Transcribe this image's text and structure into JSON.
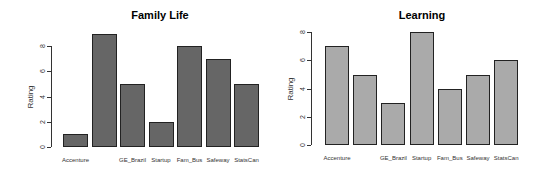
{
  "chart_data": [
    {
      "type": "bar",
      "title": "Family Life",
      "xlabel": "",
      "ylabel": "Rating",
      "categories": [
        "Accenture",
        "",
        "GE_Brazil",
        "Startup",
        "Fam_Bus",
        "Safeway",
        "StatsCan"
      ],
      "values": [
        1,
        9,
        5,
        2,
        8,
        7,
        5
      ],
      "yticks": [
        "0",
        "2",
        "4",
        "6",
        "8"
      ],
      "ylim": [
        0,
        9
      ],
      "grid": false,
      "bar_color": "#666666",
      "layout": {
        "left": 0,
        "axis_x": 55,
        "y0": 147,
        "px_per_unit": 12.6,
        "bar_start": 63,
        "bar_width": 25,
        "bar_step": 28.5,
        "title_x": 160,
        "ylabel_x": 30
      }
    },
    {
      "type": "bar",
      "title": "Learning",
      "xlabel": "",
      "ylabel": "Rating",
      "categories": [
        "Accenture",
        "",
        "GE_Brazil",
        "Startup",
        "Fam_Bus",
        "Safeway",
        "StatsCan"
      ],
      "values": [
        7,
        5,
        3,
        8,
        4,
        5,
        6
      ],
      "yticks": [
        "0",
        "2",
        "4",
        "6",
        "8"
      ],
      "ylim": [
        0,
        8
      ],
      "grid": false,
      "bar_color": "#aaaaaa",
      "layout": {
        "left": 0,
        "axis_x": 315,
        "y0": 145,
        "px_per_unit": 14.1,
        "bar_start": 325,
        "bar_width": 24,
        "bar_step": 28.2,
        "title_x": 422,
        "ylabel_x": 290
      }
    }
  ]
}
